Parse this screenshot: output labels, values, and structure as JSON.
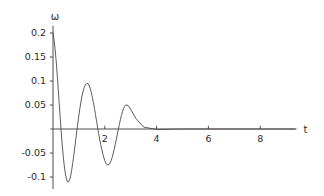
{
  "chart_data": {
    "type": "line",
    "title": "",
    "xlabel": "t",
    "ylabel": "ω",
    "xlim": [
      -0.1,
      9.4
    ],
    "ylim": [
      -0.125,
      0.215
    ],
    "grid": false,
    "legend": false,
    "x_ticks": [
      2,
      4,
      6,
      8
    ],
    "x_tick_labels": [
      "2",
      "4",
      "6",
      "8"
    ],
    "y_ticks": [
      0.2,
      0.15,
      0.1,
      0.05,
      -0.05,
      -0.1
    ],
    "y_tick_labels": [
      "0.2",
      "0.15",
      "0.1",
      "0.05",
      "-0.05",
      "-0.1"
    ],
    "series": [
      {
        "name": "omega",
        "color": "#4a4a4a",
        "x": [
          0.0,
          0.04,
          0.08,
          0.12,
          0.16,
          0.2,
          0.24,
          0.28,
          0.32,
          0.36,
          0.4,
          0.44,
          0.48,
          0.52,
          0.56,
          0.6,
          0.64,
          0.68,
          0.72,
          0.76,
          0.8,
          0.84,
          0.88,
          0.92,
          0.96,
          1.0,
          1.04,
          1.08,
          1.12,
          1.16,
          1.2,
          1.24,
          1.28,
          1.32,
          1.36,
          1.4,
          1.44,
          1.48,
          1.52,
          1.56,
          1.6,
          1.64,
          1.68,
          1.72,
          1.76,
          1.8,
          1.84,
          1.88,
          1.92,
          1.96,
          2.0,
          2.04,
          2.08,
          2.12,
          2.16,
          2.2,
          2.24,
          2.28,
          2.32,
          2.36,
          2.4,
          2.44,
          2.48,
          2.52,
          2.56,
          2.6,
          2.64,
          2.68,
          2.72,
          2.76,
          2.8,
          2.9,
          3.0,
          3.2,
          3.5,
          4.0,
          5.0,
          6.0,
          7.0,
          8.0,
          9.0,
          9.35
        ],
        "y": [
          0.2,
          0.186,
          0.167,
          0.143,
          0.115,
          0.085,
          0.053,
          0.022,
          -0.008,
          -0.035,
          -0.059,
          -0.079,
          -0.094,
          -0.104,
          -0.11,
          -0.11,
          -0.106,
          -0.098,
          -0.086,
          -0.072,
          -0.056,
          -0.039,
          -0.021,
          -0.004,
          0.013,
          0.029,
          0.044,
          0.057,
          0.069,
          0.078,
          0.086,
          0.091,
          0.094,
          0.095,
          0.094,
          0.09,
          0.084,
          0.076,
          0.066,
          0.055,
          0.043,
          0.03,
          0.017,
          0.004,
          -0.009,
          -0.021,
          -0.032,
          -0.042,
          -0.051,
          -0.059,
          -0.066,
          -0.071,
          -0.074,
          -0.075,
          -0.074,
          -0.071,
          -0.066,
          -0.06,
          -0.052,
          -0.043,
          -0.033,
          -0.023,
          -0.012,
          -0.001,
          0.009,
          0.019,
          0.028,
          0.036,
          0.042,
          0.047,
          0.05,
          0.049,
          0.041,
          0.022,
          0.004,
          -0.001,
          0.0,
          0.0,
          0.0,
          0.0,
          0.0,
          0.0
        ]
      }
    ]
  },
  "axes": {
    "x_axis_label": "t",
    "y_axis_label": "ω"
  }
}
